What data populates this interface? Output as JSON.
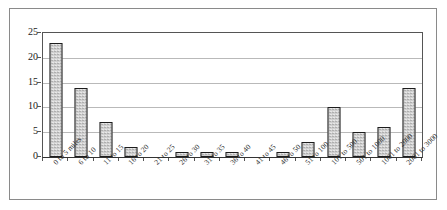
{
  "chart_data": {
    "type": "bar",
    "title": "",
    "subtitle": "",
    "xlabel": "",
    "ylabel": "",
    "ylim": [
      0,
      25
    ],
    "ytick_values": [
      0,
      5,
      10,
      15,
      20,
      25
    ],
    "ytick_labels": [
      "0",
      "5",
      "10",
      "15",
      "20",
      "25"
    ],
    "grid": true,
    "legend": false,
    "legend_position": "none",
    "categories": [
      "0 to 5 miles",
      "6 to 10",
      "11 to 15",
      "16 to 20",
      "21 to 25",
      "26 to 30",
      "31 to 35",
      "36 to 40",
      "41 to 45",
      "46 to 50",
      "51 to 100",
      "101 to 500",
      "501 to 1000",
      "1001 to 2000",
      "2001 to 3000"
    ],
    "values": [
      23,
      14,
      7,
      2,
      0,
      1,
      1,
      1,
      0,
      1,
      3,
      10,
      5,
      6,
      14
    ],
    "bar_fill_color": "#cfcfcf",
    "bar_edge_color": "#1d1d1d",
    "gridline_color": "#b9b9b9",
    "axis_color": "#555555",
    "plot_background": "#ffffff",
    "frame_border_color": "#8a8a8a"
  }
}
